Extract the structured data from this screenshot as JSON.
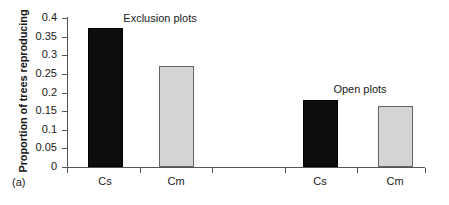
{
  "panel": {
    "tag": "(a)"
  },
  "chart_data": {
    "type": "bar",
    "title": "",
    "xlabel": "",
    "ylabel": "Proportion of trees reproducing",
    "ylim": [
      0,
      0.4
    ],
    "grid": false,
    "legend_position": "none",
    "categories": [
      "Cs",
      "Cm",
      "Cs",
      "Cm"
    ],
    "values": [
      0.372,
      0.27,
      0.181,
      0.163
    ],
    "bar_colors": [
      "#0d0d0d",
      "#d4d4d4",
      "#0d0d0d",
      "#d4d4d4"
    ],
    "ytick_labels": [
      "0",
      "0.05",
      "0.1",
      "0.15",
      "0.2",
      "0.25",
      "0.3",
      "0.35",
      "0.4"
    ],
    "ytick_values": [
      0,
      0.05,
      0.1,
      0.15,
      0.2,
      0.25,
      0.3,
      0.35,
      0.4
    ],
    "groups": [
      {
        "label": "Exclusion plots",
        "categories": [
          "Cs",
          "Cm"
        ],
        "values": [
          0.372,
          0.27
        ]
      },
      {
        "label": "Open plots",
        "categories": [
          "Cs",
          "Cm"
        ],
        "values": [
          0.181,
          0.163
        ]
      }
    ],
    "annotations": [
      {
        "text": "Exclusion plots",
        "x": 160,
        "y": 13
      },
      {
        "text": "Open plots",
        "x": 360,
        "y": 84
      }
    ]
  },
  "colors": {
    "bar_dark": "#0d0d0d",
    "bar_light": "#d4d4d4",
    "bar_light_border": "#636363",
    "axis": "#555555",
    "text": "#1a1a1a",
    "background": "#ffffff"
  }
}
